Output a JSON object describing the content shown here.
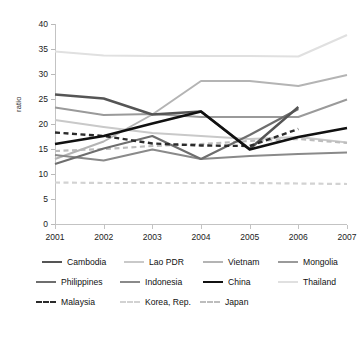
{
  "chart_data": {
    "type": "line",
    "title": "",
    "xlabel": "",
    "ylabel": "ratio",
    "x": [
      2001,
      2002,
      2003,
      2004,
      2005,
      2006,
      2007
    ],
    "categories": [
      "2001",
      "2002",
      "2003",
      "2004",
      "2005",
      "2006",
      "2007"
    ],
    "ylim": [
      0,
      40
    ],
    "yticks": [
      0,
      5,
      10,
      15,
      20,
      25,
      30,
      35,
      40
    ],
    "ytick_labels": [
      "0",
      "5",
      "10",
      "15",
      "20",
      "25",
      "30",
      "35",
      "40"
    ],
    "grid": false,
    "legend_position": "bottom",
    "series": [
      {
        "name": "Cambodia",
        "color": "#555555",
        "style": "solid",
        "width": 2.4,
        "values": [
          25.9,
          25.1,
          21.9,
          22.5,
          15.0,
          23.4,
          null
        ]
      },
      {
        "name": "Lao PDR",
        "color": "#c9c9c9",
        "style": "solid",
        "width": 2.0,
        "values": [
          20.8,
          19.4,
          18.2,
          17.6,
          17.0,
          17.4,
          16.3
        ]
      },
      {
        "name": "Vietnam",
        "color": "#b4b4b4",
        "style": "solid",
        "width": 2.0,
        "values": [
          13.0,
          16.5,
          21.9,
          28.6,
          28.6,
          27.6,
          29.8
        ]
      },
      {
        "name": "Mongolia",
        "color": "#9a9a9a",
        "style": "solid",
        "width": 2.0,
        "values": [
          23.3,
          21.8,
          22.0,
          21.4,
          21.4,
          21.4,
          24.9
        ]
      },
      {
        "name": "Philippines",
        "color": "#6e6e6e",
        "style": "solid",
        "width": 2.2,
        "values": [
          12.0,
          15.1,
          17.6,
          13.0,
          17.8,
          23.0,
          null
        ]
      },
      {
        "name": "Indonesia",
        "color": "#8a8a8a",
        "style": "solid",
        "width": 2.0,
        "values": [
          13.8,
          12.7,
          14.9,
          13.0,
          13.6,
          14.0,
          14.3
        ]
      },
      {
        "name": "China",
        "color": "#111111",
        "style": "solid",
        "width": 2.6,
        "values": [
          16.0,
          17.6,
          20.1,
          22.5,
          14.9,
          17.4,
          19.2
        ]
      },
      {
        "name": "Thailand",
        "color": "#e0e0e0",
        "style": "solid",
        "width": 2.2,
        "values": [
          34.5,
          33.7,
          33.6,
          33.6,
          33.6,
          33.5,
          37.8
        ]
      },
      {
        "name": "Malaysia",
        "color": "#2b2b2b",
        "style": "dashed",
        "width": 2.4,
        "values": [
          18.3,
          17.6,
          16.1,
          15.7,
          15.6,
          19.0,
          null
        ]
      },
      {
        "name": "Korea, Rep.",
        "color": "#d2d2d2",
        "style": "dashed",
        "width": 2.2,
        "values": [
          8.3,
          8.2,
          8.2,
          8.2,
          8.2,
          8.1,
          8.0
        ]
      },
      {
        "name": "Japan",
        "color": "#bdbdbd",
        "style": "dashed",
        "width": 2.2,
        "values": [
          14.6,
          15.0,
          15.6,
          16.0,
          16.6,
          17.0,
          16.2
        ]
      }
    ]
  },
  "legend": {
    "rows": [
      [
        {
          "label": "Cambodia",
          "color": "#555555",
          "style": "solid"
        },
        {
          "label": "Lao PDR",
          "color": "#c9c9c9",
          "style": "solid"
        },
        {
          "label": "Vietnam",
          "color": "#b4b4b4",
          "style": "solid"
        },
        {
          "label": "Mongolia",
          "color": "#9a9a9a",
          "style": "solid"
        }
      ],
      [
        {
          "label": "Philippines",
          "color": "#6e6e6e",
          "style": "solid"
        },
        {
          "label": "Indonesia",
          "color": "#8a8a8a",
          "style": "solid"
        },
        {
          "label": "China",
          "color": "#111111",
          "style": "solid"
        },
        {
          "label": "Thailand",
          "color": "#e0e0e0",
          "style": "solid"
        }
      ],
      [
        {
          "label": "Malaysia",
          "color": "#2b2b2b",
          "style": "dashed"
        },
        {
          "label": "Korea, Rep.",
          "color": "#d2d2d2",
          "style": "dashed"
        },
        {
          "label": "Japan",
          "color": "#bdbdbd",
          "style": "dashed"
        }
      ]
    ]
  },
  "colors": {
    "axis": "#c3c3c3",
    "tick_text": "#222222",
    "background": "#ffffff"
  }
}
